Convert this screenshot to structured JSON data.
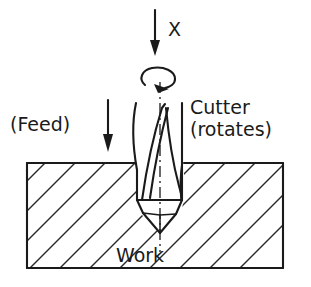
{
  "figure": {
    "background_color": "#ffffff",
    "line_color": "#1a1a1a",
    "hatch_color": "#2a2a2a"
  },
  "labels": {
    "axis": "X",
    "feed": "(Feed)",
    "cutter_line1": "Cutter",
    "cutter_line2": "(rotates)",
    "work": "Work"
  },
  "icons": {
    "axis_arrow": "down-arrow-icon",
    "feed_arrow": "down-arrow-icon",
    "rotation_arrow": "rotation-arrow-icon",
    "centerline": "center-line-icon",
    "hatching": "section-hatch-icon"
  },
  "geometry": {
    "workpiece": {
      "left": 27,
      "top": 163,
      "right": 283,
      "bottom": 268
    },
    "tool_axis_x": 160,
    "axis_arrow": {
      "x": 155,
      "y_top": 10,
      "y_bottom": 55
    },
    "feed_arrow": {
      "x": 108,
      "y_top": 100,
      "y_bottom": 152
    },
    "rotation_ellipse": {
      "cx": 158,
      "cy": 78,
      "rx": 17,
      "ry": 9
    }
  }
}
